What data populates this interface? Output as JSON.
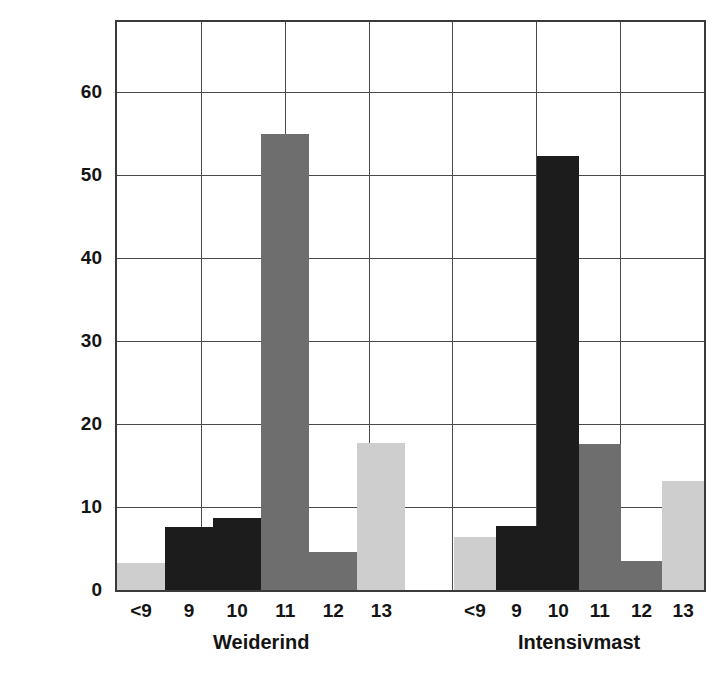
{
  "chart_data": {
    "type": "bar",
    "title": "",
    "subtitle": "",
    "xlabel": "",
    "ylabel": "Häufigkeit (%)",
    "ylim": [
      0,
      68.5
    ],
    "yticks": [
      0,
      10,
      20,
      30,
      40,
      50,
      60
    ],
    "ytick_labels": [
      "0",
      "10",
      "20",
      "30",
      "40",
      "50",
      "60"
    ],
    "grid": "both",
    "legend": "none",
    "categories": [
      "<9",
      "9",
      "10",
      "11",
      "12",
      "13"
    ],
    "groups": [
      {
        "name": "Weiderind",
        "categories": [
          "<9",
          "9",
          "10",
          "11",
          "12",
          "13"
        ],
        "values": [
          3.2,
          7.6,
          8.7,
          55.0,
          4.6,
          17.7
        ],
        "bar_colors": [
          "#cecece",
          "#1c1c1c",
          "#1c1c1c",
          "#6e6e6e",
          "#6e6e6e",
          "#cecece"
        ]
      },
      {
        "name": "Intensivmast",
        "categories": [
          "<9",
          "9",
          "10",
          "11",
          "12",
          "13"
        ],
        "values": [
          6.4,
          7.7,
          52.3,
          17.6,
          3.5,
          13.1
        ],
        "bar_colors": [
          "#cecece",
          "#1c1c1c",
          "#1c1c1c",
          "#6e6e6e",
          "#6e6e6e",
          "#cecece"
        ]
      }
    ],
    "colors": {
      "light_gray": "#cecece",
      "mid_gray": "#6e6e6e",
      "black": "#1c1c1c",
      "axis": "#3a3a3a",
      "grid": "#4a4a4a",
      "background": "#ffffff",
      "text": "#141414"
    },
    "x_gridline_count": 7
  }
}
